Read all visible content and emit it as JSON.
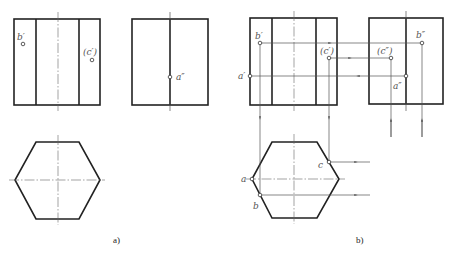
{
  "figure_a": {
    "caption": "a)",
    "labels": {
      "b_front": "b′",
      "c_front": "(c′)",
      "a_side": "a″"
    }
  },
  "figure_b": {
    "caption": "b)",
    "labels": {
      "b_front": "b′",
      "c_front": "(c′)",
      "a_front": "a′",
      "b_side": "b″",
      "c_side": "(c″)",
      "a_side": "a″",
      "a_top": "a",
      "b_top": "b",
      "c_top": "c"
    }
  },
  "colors": {
    "outline": "#222222",
    "construction": "#555555",
    "label": "#555555"
  }
}
